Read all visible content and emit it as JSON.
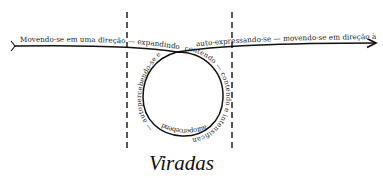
{
  "diagram": {
    "title": "Viradas",
    "main_path": {
      "left_label": "Movendo-se em uma direção — expandindo — inibindo e limitando",
      "right_label": "auto-expressando-se — movendo-se em direção à interação"
    },
    "loop": {
      "right_arc_label": "contendo — contendo e intensificando —",
      "bottom_arc_label": "autopercebendo-se",
      "left_arc_label": "— autopercebendo-se e autoconhecendo-se"
    },
    "colors": {
      "line": "#111111",
      "text": "#1a1a1a",
      "background": "#ffffff"
    }
  }
}
